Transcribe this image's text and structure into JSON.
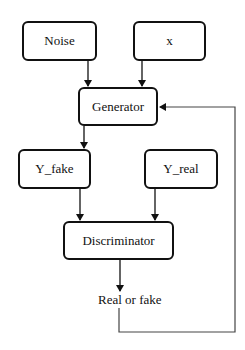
{
  "diagram": {
    "nodes": {
      "noise": {
        "label": "Noise"
      },
      "x": {
        "label": "x"
      },
      "generator": {
        "label": "Generator"
      },
      "y_fake": {
        "label": "Y_fake"
      },
      "y_real": {
        "label": "Y_real"
      },
      "discriminator": {
        "label": "Discriminator"
      },
      "output": {
        "label": "Real or fake"
      }
    },
    "edges": [
      {
        "from": "Noise",
        "to": "Generator"
      },
      {
        "from": "x",
        "to": "Generator"
      },
      {
        "from": "Generator",
        "to": "Y_fake"
      },
      {
        "from": "Y_fake",
        "to": "Discriminator"
      },
      {
        "from": "Y_real",
        "to": "Discriminator"
      },
      {
        "from": "Discriminator",
        "to": "Real or fake"
      },
      {
        "from": "Real or fake",
        "to": "Generator",
        "type": "feedback"
      }
    ],
    "colors": {
      "stroke": "#111111",
      "feedback_line": "#444444",
      "background": "#ffffff"
    }
  }
}
